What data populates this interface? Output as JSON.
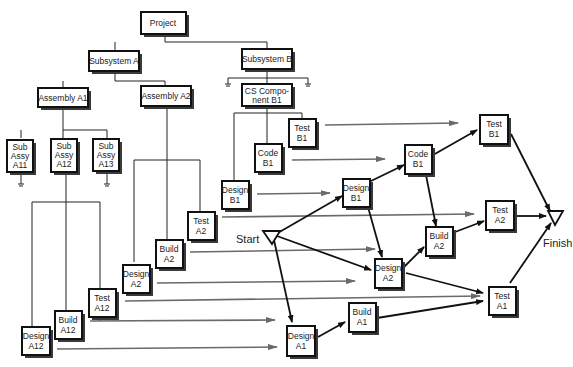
{
  "diagram": {
    "type": "wbs-to-network",
    "tree": {
      "root": "Project",
      "subsystems": [
        "Subsystem A",
        "Subsystem B"
      ],
      "assemblies": [
        "Assembly A1",
        "Assembly A2"
      ],
      "cs_component": [
        "CS Compo-",
        "nent B1"
      ],
      "sub_assemblies": [
        [
          "Sub",
          "Assy",
          "A11"
        ],
        [
          "Sub",
          "Assy",
          "A12"
        ],
        [
          "Sub",
          "Assy",
          "A13"
        ]
      ]
    },
    "work_packages": {
      "design_a12": [
        "Design",
        "A12"
      ],
      "build_a12": [
        "Build",
        "A12"
      ],
      "test_a12": [
        "Test",
        "A12"
      ],
      "design_a2": [
        "Design",
        "A2"
      ],
      "build_a2": [
        "Build",
        "A2"
      ],
      "test_a2": [
        "Test",
        "A2"
      ],
      "design_b1": [
        "Design",
        "B1"
      ],
      "code_b1": [
        "Code",
        "B1"
      ],
      "test_b1": [
        "Test",
        "B1"
      ]
    },
    "network": {
      "start_label": "Start",
      "finish_label": "Finish",
      "nodes": {
        "design_b1": [
          "Design",
          "B1"
        ],
        "code_b1": [
          "Code",
          "B1"
        ],
        "test_b1": [
          "Test",
          "B1"
        ],
        "build_a2": [
          "Build",
          "A2"
        ],
        "test_a2": [
          "Test",
          "A2"
        ],
        "design_a2": [
          "Design",
          "A2"
        ],
        "test_a1": [
          "Test",
          "A1"
        ],
        "build_a1": [
          "Build",
          "A1"
        ],
        "design_a1": [
          "Design",
          "A1"
        ]
      },
      "edges": [
        [
          "Start",
          "Design B1"
        ],
        [
          "Start",
          "Design A2"
        ],
        [
          "Start",
          "Design A1"
        ],
        [
          "Design B1",
          "Code B1"
        ],
        [
          "Design B1",
          "Design A2"
        ],
        [
          "Code B1",
          "Test B1"
        ],
        [
          "Code B1",
          "Build A2"
        ],
        [
          "Design A2",
          "Build A2"
        ],
        [
          "Design A2",
          "Test A1"
        ],
        [
          "Build A2",
          "Test A2"
        ],
        [
          "Design A1",
          "Build A1"
        ],
        [
          "Build A1",
          "Test A1"
        ],
        [
          "Test B1",
          "Finish"
        ],
        [
          "Test A2",
          "Finish"
        ],
        [
          "Test A1",
          "Finish"
        ]
      ]
    },
    "colors": {
      "box_border": "#111111",
      "shadow": "#3a3a3a",
      "mapping_arrows": "#6a6a6a",
      "network_arrows": "#111111"
    }
  }
}
